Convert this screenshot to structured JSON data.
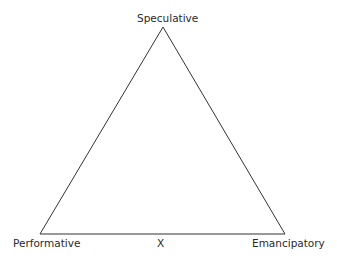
{
  "diagram": {
    "type": "triangle",
    "vertices": {
      "top": {
        "label": "Speculative",
        "x": 163,
        "y": 27
      },
      "bottom_left": {
        "label": "Performative",
        "x": 40,
        "y": 234
      },
      "bottom_right": {
        "label": "Emancipatory",
        "x": 285,
        "y": 234
      }
    },
    "center_marker": {
      "label": "X"
    },
    "line_color": "#333333"
  }
}
